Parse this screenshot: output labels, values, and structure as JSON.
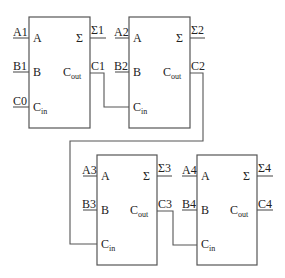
{
  "diagram": {
    "adders": [
      {
        "id": "FA1",
        "inputs": {
          "A": "A1",
          "B": "B1",
          "Cin": "C0"
        },
        "outputs": {
          "sum": "Σ1",
          "cout": "C1"
        }
      },
      {
        "id": "FA2",
        "inputs": {
          "A": "A2",
          "B": "B2",
          "Cin": "C1"
        },
        "outputs": {
          "sum": "Σ2",
          "cout": "C2"
        }
      },
      {
        "id": "FA3",
        "inputs": {
          "A": "A3",
          "B": "B3",
          "Cin": "C2"
        },
        "outputs": {
          "sum": "Σ3",
          "cout": "C3"
        }
      },
      {
        "id": "FA4",
        "inputs": {
          "A": "A4",
          "B": "B4",
          "Cin": "C3"
        },
        "outputs": {
          "sum": "Σ4",
          "cout": "C4"
        }
      }
    ],
    "port_labels": {
      "a": "A",
      "b": "B",
      "sum": "Σ",
      "c_main": "C",
      "cout_sub": "out",
      "cin_sub": "in"
    },
    "signals": {
      "a1": "A1",
      "b1": "B1",
      "c0": "C0",
      "s1": "Σ1",
      "c1": "C1",
      "a2": "A2",
      "b2": "B2",
      "s2": "Σ2",
      "c2": "C2",
      "a3": "A3",
      "b3": "B3",
      "s3": "Σ3",
      "c3": "C3",
      "a4": "A4",
      "b4": "B4",
      "s4": "Σ4",
      "c4": "C4"
    },
    "colors": {
      "line": "#555555",
      "text": "#222222",
      "background": "#ffffff"
    }
  }
}
